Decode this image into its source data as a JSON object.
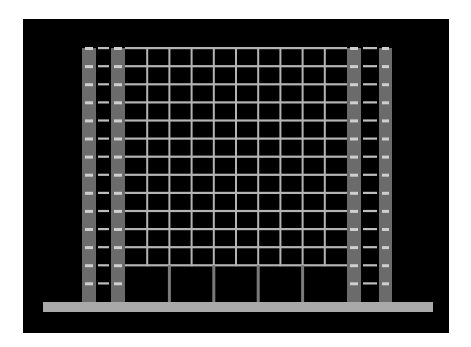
{
  "image": {
    "subject": "Building facade elevation drawing",
    "description": "Grey line drawing of a multi-storey grid building with twin columns on each side, on a black background",
    "floors_grid_lines": 13,
    "grid_bays": 10,
    "ground_floor_bays": 5,
    "tower_levels": 14,
    "colors": {
      "background": "#000000",
      "page": "#ffffff",
      "column": "#6b6b6b",
      "column_highlight": "#cfcfcf",
      "grid_line": "#b4b4b4",
      "rail": "#bebebe",
      "ground_slab": "#a9a9a9",
      "ground_post": "#7a7a7a"
    }
  }
}
